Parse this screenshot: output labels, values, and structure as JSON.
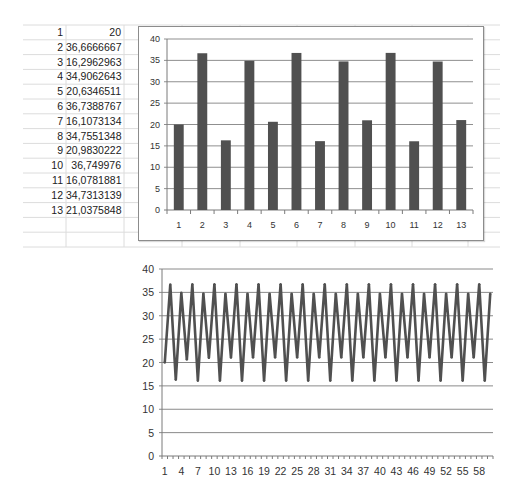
{
  "spreadsheet": {
    "rows": [
      {
        "index": "1",
        "value": "20"
      },
      {
        "index": "2",
        "value": "36,6666667"
      },
      {
        "index": "3",
        "value": "16,2962963"
      },
      {
        "index": "4",
        "value": "34,9062643"
      },
      {
        "index": "5",
        "value": "20,6346511"
      },
      {
        "index": "6",
        "value": "36,7388767"
      },
      {
        "index": "7",
        "value": "16,1073134"
      },
      {
        "index": "8",
        "value": "34,7551348"
      },
      {
        "index": "9",
        "value": "20,9830222"
      },
      {
        "index": "10",
        "value": "36,749976"
      },
      {
        "index": "11",
        "value": "16,0781881"
      },
      {
        "index": "12",
        "value": "34,7313139"
      },
      {
        "index": "13",
        "value": "21,0375848"
      }
    ]
  },
  "chart_data": [
    {
      "type": "bar",
      "title": "",
      "xlabel": "",
      "ylabel": "",
      "categories": [
        "1",
        "2",
        "3",
        "4",
        "5",
        "6",
        "7",
        "8",
        "9",
        "10",
        "11",
        "12",
        "13"
      ],
      "values": [
        20,
        36.6666667,
        16.2962963,
        34.9062643,
        20.6346511,
        36.7388767,
        16.1073134,
        34.7551348,
        20.9830222,
        36.749976,
        16.0781881,
        34.7313139,
        21.0375848
      ],
      "ylim": [
        0,
        40
      ],
      "yticks": [
        0,
        5,
        10,
        15,
        20,
        25,
        30,
        35,
        40
      ],
      "grid": true,
      "legend": "none",
      "color": "#505050"
    },
    {
      "type": "line",
      "title": "",
      "xlabel": "",
      "ylabel": "",
      "x": [
        1,
        2,
        3,
        4,
        5,
        6,
        7,
        8,
        9,
        10,
        11,
        12,
        13,
        14,
        15,
        16,
        17,
        18,
        19,
        20,
        21,
        22,
        23,
        24,
        25,
        26,
        27,
        28,
        29,
        30,
        31,
        32,
        33,
        34,
        35,
        36,
        37,
        38,
        39,
        40,
        41,
        42,
        43,
        44,
        45,
        46,
        47,
        48,
        49,
        50,
        51,
        52,
        53,
        54,
        55,
        56,
        57,
        58,
        59,
        60
      ],
      "values": [
        20,
        36.67,
        16.3,
        34.91,
        20.63,
        36.74,
        16.11,
        34.76,
        20.98,
        36.75,
        16.08,
        34.73,
        21.04,
        36.75,
        16.07,
        34.73,
        21.05,
        36.75,
        16.07,
        34.73,
        21.05,
        36.75,
        16.07,
        34.73,
        21.05,
        36.75,
        16.07,
        34.73,
        21.05,
        36.75,
        16.07,
        34.73,
        21.05,
        36.75,
        16.07,
        34.73,
        21.05,
        36.75,
        16.07,
        34.73,
        21.05,
        36.75,
        16.07,
        34.73,
        21.05,
        36.75,
        16.07,
        34.73,
        21.05,
        36.75,
        16.07,
        34.73,
        21.05,
        36.75,
        16.07,
        34.73,
        21.05,
        36.75,
        16.07,
        34.73
      ],
      "x_tick_labels": [
        "1",
        "4",
        "7",
        "10",
        "13",
        "16",
        "19",
        "22",
        "25",
        "28",
        "31",
        "34",
        "37",
        "40",
        "43",
        "46",
        "49",
        "52",
        "55",
        "58"
      ],
      "ylim": [
        0,
        40
      ],
      "yticks": [
        0,
        5,
        10,
        15,
        20,
        25,
        30,
        35,
        40
      ],
      "grid": true,
      "legend": "none",
      "color": "#505050"
    }
  ]
}
